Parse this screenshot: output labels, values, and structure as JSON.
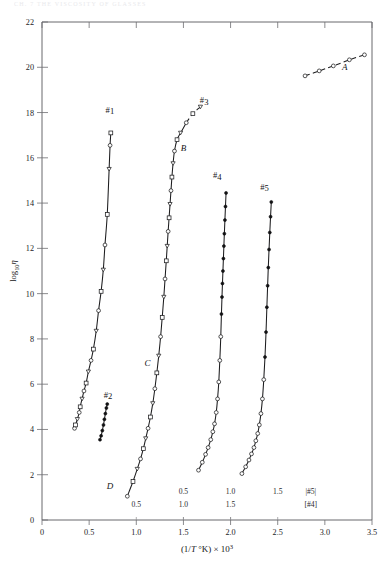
{
  "page": {
    "running_header": "CH. 7  THE VISCOSITY OF GLASSES"
  },
  "chart_data": {
    "type": "line",
    "title": "",
    "xlabel": "(1/T °K) × 10³",
    "ylabel": "log₁₀η",
    "xlim": [
      0,
      3.5
    ],
    "ylim": [
      0,
      22
    ],
    "xticks": [
      0,
      0.5,
      1.0,
      1.5,
      2.0,
      2.5,
      3.0,
      3.5
    ],
    "xticklabels": [
      "0",
      "0.5",
      "1.0",
      "1.5",
      "2.0",
      "2.5",
      "3.0",
      "3.5"
    ],
    "yticks": [
      0,
      2,
      4,
      6,
      8,
      10,
      12,
      14,
      16,
      18,
      20,
      22
    ],
    "yticklabels": [
      "0",
      "2",
      "4",
      "6",
      "8",
      "10",
      "12",
      "14",
      "16",
      "18",
      "20",
      "22"
    ],
    "grid": false,
    "legend": "none",
    "secondary_axes": [
      {
        "name": "#5",
        "bracket_label": "|#5|",
        "ticks": [
          0.5,
          1.0,
          1.5
        ],
        "ticklabels": [
          "0.5",
          "1.0",
          "1.5"
        ]
      },
      {
        "name": "#4",
        "bracket_label": "[#4]",
        "ticks": [
          0.5,
          1.0,
          1.5
        ],
        "ticklabels": [
          "0.5",
          "1.0",
          "1.5"
        ]
      }
    ],
    "annotations": [
      {
        "text": "#1",
        "x": 0.72,
        "y": 18.0
      },
      {
        "text": "#2",
        "x": 0.7,
        "y": 5.4
      },
      {
        "text": "#3",
        "x": 1.72,
        "y": 18.4
      },
      {
        "text": "#4",
        "x": 1.86,
        "y": 15.1
      },
      {
        "text": "#5",
        "x": 2.36,
        "y": 14.6
      },
      {
        "text": "A",
        "x": 3.21,
        "y": 19.9
      },
      {
        "text": "B",
        "x": 1.5,
        "y": 16.3
      },
      {
        "text": "C",
        "x": 1.12,
        "y": 6.8
      },
      {
        "text": "D",
        "x": 0.72,
        "y": 1.35
      }
    ],
    "series": [
      {
        "name": "A",
        "label": "A",
        "marker": "open-circle",
        "linestyle": "dashed",
        "points": [
          {
            "x": 2.79,
            "y": 19.62
          },
          {
            "x": 2.94,
            "y": 19.84
          },
          {
            "x": 3.09,
            "y": 20.06
          },
          {
            "x": 3.26,
            "y": 20.33
          },
          {
            "x": 3.42,
            "y": 20.55
          }
        ]
      },
      {
        "name": "#1",
        "label": "#1",
        "marker": "mixed-open",
        "linestyle": "solid",
        "points": [
          {
            "x": 0.345,
            "y": 4.05
          },
          {
            "x": 0.355,
            "y": 4.2
          },
          {
            "x": 0.375,
            "y": 4.45
          },
          {
            "x": 0.395,
            "y": 4.75
          },
          {
            "x": 0.405,
            "y": 5.0
          },
          {
            "x": 0.425,
            "y": 5.35
          },
          {
            "x": 0.445,
            "y": 5.7
          },
          {
            "x": 0.468,
            "y": 6.05
          },
          {
            "x": 0.492,
            "y": 6.55
          },
          {
            "x": 0.52,
            "y": 7.05
          },
          {
            "x": 0.545,
            "y": 7.55
          },
          {
            "x": 0.575,
            "y": 8.35
          },
          {
            "x": 0.6,
            "y": 9.25
          },
          {
            "x": 0.627,
            "y": 10.1
          },
          {
            "x": 0.65,
            "y": 11.05
          },
          {
            "x": 0.668,
            "y": 12.15
          },
          {
            "x": 0.692,
            "y": 13.5
          },
          {
            "x": 0.712,
            "y": 15.5
          },
          {
            "x": 0.722,
            "y": 16.55
          },
          {
            "x": 0.73,
            "y": 17.1
          }
        ]
      },
      {
        "name": "#2",
        "label": "#2",
        "marker": "filled-circle",
        "linestyle": "solid",
        "points": [
          {
            "x": 0.615,
            "y": 3.55
          },
          {
            "x": 0.627,
            "y": 3.72
          },
          {
            "x": 0.64,
            "y": 3.95
          },
          {
            "x": 0.652,
            "y": 4.2
          },
          {
            "x": 0.662,
            "y": 4.45
          },
          {
            "x": 0.672,
            "y": 4.7
          },
          {
            "x": 0.683,
            "y": 4.95
          },
          {
            "x": 0.692,
            "y": 5.12
          }
        ]
      },
      {
        "name": "#3",
        "label": "#3",
        "marker": "mixed-open",
        "linestyle": "solid-then-dashed",
        "points": [
          {
            "x": 0.905,
            "y": 1.05
          },
          {
            "x": 0.965,
            "y": 1.7
          },
          {
            "x": 1.01,
            "y": 2.25
          },
          {
            "x": 1.045,
            "y": 2.7
          },
          {
            "x": 1.075,
            "y": 3.15
          },
          {
            "x": 1.1,
            "y": 3.6
          },
          {
            "x": 1.125,
            "y": 4.05
          },
          {
            "x": 1.15,
            "y": 4.55
          },
          {
            "x": 1.175,
            "y": 5.15
          },
          {
            "x": 1.197,
            "y": 5.8
          },
          {
            "x": 1.218,
            "y": 6.5
          },
          {
            "x": 1.238,
            "y": 7.25
          },
          {
            "x": 1.258,
            "y": 8.1
          },
          {
            "x": 1.275,
            "y": 8.95
          },
          {
            "x": 1.292,
            "y": 9.85
          },
          {
            "x": 1.305,
            "y": 10.65
          },
          {
            "x": 1.318,
            "y": 11.45
          },
          {
            "x": 1.328,
            "y": 12.1
          },
          {
            "x": 1.338,
            "y": 12.75
          },
          {
            "x": 1.348,
            "y": 13.35
          },
          {
            "x": 1.358,
            "y": 13.95
          },
          {
            "x": 1.368,
            "y": 14.55
          },
          {
            "x": 1.378,
            "y": 15.15
          },
          {
            "x": 1.39,
            "y": 15.75
          },
          {
            "x": 1.405,
            "y": 16.3
          },
          {
            "x": 1.432,
            "y": 16.8
          },
          {
            "x": 1.47,
            "y": 17.1
          },
          {
            "x": 1.53,
            "y": 17.55
          },
          {
            "x": 1.6,
            "y": 17.95
          },
          {
            "x": 1.68,
            "y": 18.25
          }
        ],
        "dash_from_index": 27
      },
      {
        "name": "#4",
        "label": "#4",
        "marker": "filled-upper-open-lower",
        "linestyle": "solid",
        "points": [
          {
            "x": 1.66,
            "y": 2.2
          },
          {
            "x": 1.7,
            "y": 2.55
          },
          {
            "x": 1.735,
            "y": 2.9
          },
          {
            "x": 1.762,
            "y": 3.2
          },
          {
            "x": 1.79,
            "y": 3.55
          },
          {
            "x": 1.812,
            "y": 3.9
          },
          {
            "x": 1.83,
            "y": 4.25
          },
          {
            "x": 1.848,
            "y": 4.75
          },
          {
            "x": 1.862,
            "y": 5.35
          },
          {
            "x": 1.875,
            "y": 6.1
          },
          {
            "x": 1.886,
            "y": 7.05
          },
          {
            "x": 1.896,
            "y": 8.1
          },
          {
            "x": 1.903,
            "y": 9.1
          },
          {
            "x": 1.909,
            "y": 9.85
          },
          {
            "x": 1.914,
            "y": 10.45
          },
          {
            "x": 1.919,
            "y": 11.0
          },
          {
            "x": 1.924,
            "y": 11.55
          },
          {
            "x": 1.929,
            "y": 12.1
          },
          {
            "x": 1.934,
            "y": 12.65
          },
          {
            "x": 1.94,
            "y": 13.25
          },
          {
            "x": 1.946,
            "y": 13.85
          },
          {
            "x": 1.952,
            "y": 14.45
          }
        ]
      },
      {
        "name": "#5",
        "label": "#5",
        "marker": "filled-upper-open-lower",
        "linestyle": "solid",
        "points": [
          {
            "x": 2.12,
            "y": 2.05
          },
          {
            "x": 2.16,
            "y": 2.35
          },
          {
            "x": 2.195,
            "y": 2.65
          },
          {
            "x": 2.222,
            "y": 2.92
          },
          {
            "x": 2.248,
            "y": 3.2
          },
          {
            "x": 2.268,
            "y": 3.5
          },
          {
            "x": 2.288,
            "y": 3.82
          },
          {
            "x": 2.305,
            "y": 4.2
          },
          {
            "x": 2.322,
            "y": 4.7
          },
          {
            "x": 2.338,
            "y": 5.35
          },
          {
            "x": 2.352,
            "y": 6.2
          },
          {
            "x": 2.365,
            "y": 7.2
          },
          {
            "x": 2.376,
            "y": 8.3
          },
          {
            "x": 2.385,
            "y": 9.4
          },
          {
            "x": 2.393,
            "y": 10.35
          },
          {
            "x": 2.4,
            "y": 11.15
          },
          {
            "x": 2.408,
            "y": 11.95
          },
          {
            "x": 2.416,
            "y": 12.7
          },
          {
            "x": 2.424,
            "y": 13.4
          },
          {
            "x": 2.432,
            "y": 14.05
          }
        ]
      }
    ]
  }
}
